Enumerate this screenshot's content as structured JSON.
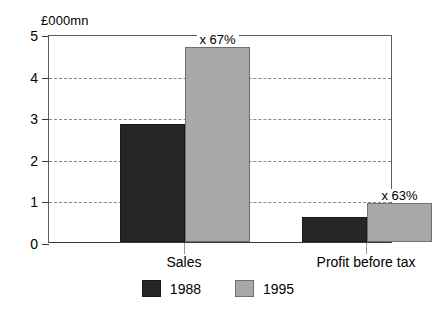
{
  "chart_data": {
    "type": "bar",
    "title": "",
    "subtitle": "",
    "xlabel": "",
    "ylabel": "£000mn",
    "ylim": [
      0,
      5
    ],
    "yticks": [
      0,
      1,
      2,
      3,
      4,
      5
    ],
    "ytick_labels": [
      "0",
      "1",
      "2",
      "3",
      "4",
      "5"
    ],
    "grid": "horizontal-dashed",
    "legend_position": "bottom-center",
    "categories": [
      "Sales",
      "Profit before tax"
    ],
    "series": [
      {
        "name": "1988",
        "color": "#262626",
        "values": [
          2.83,
          0.6
        ]
      },
      {
        "name": "1995",
        "color": "#a8a8a8",
        "values": [
          4.69,
          0.94
        ]
      }
    ],
    "annotations": [
      {
        "text": "x 67%",
        "category": "Sales",
        "series": "1995"
      },
      {
        "text": "x 63%",
        "category": "Profit before tax",
        "series": "1995"
      }
    ]
  },
  "axis": {
    "unit_caption": "£000mn"
  },
  "legend": {
    "items": [
      {
        "label": "1988",
        "color": "#262626"
      },
      {
        "label": "1995",
        "color": "#a8a8a8"
      }
    ]
  }
}
